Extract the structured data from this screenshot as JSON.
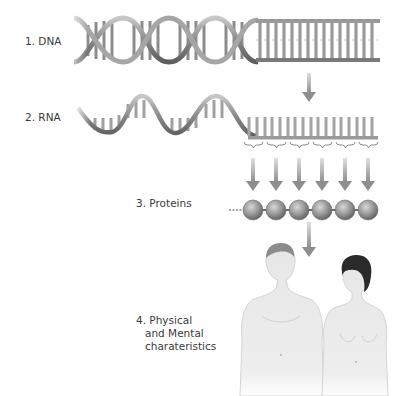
{
  "diagram": {
    "type": "flow",
    "direction": "top-to-bottom",
    "steps": [
      {
        "id": "dna",
        "label": "1. DNA",
        "visual": "double-helix-to-ladder"
      },
      {
        "id": "rna",
        "label": "2. RNA",
        "visual": "single-strand-wave-to-comb"
      },
      {
        "id": "proteins",
        "label": "3. Proteins",
        "visual": "bead-chain",
        "bead_count": 6
      },
      {
        "id": "traits",
        "label_lines": [
          "4. Physical",
          "and Mental",
          "charateristics"
        ],
        "visual": "male-and-female-figures"
      }
    ],
    "connections": [
      {
        "from": "dna",
        "to": "rna",
        "count": 1
      },
      {
        "from": "rna",
        "to": "proteins",
        "count": 6,
        "note": "codon groups bracketed"
      },
      {
        "from": "proteins",
        "to": "traits",
        "count": 1
      }
    ],
    "colors": {
      "strand": "#9a9a9a",
      "strand_dark": "#6e6e6e",
      "arrow": "#9c9c9c",
      "bead": "#8c8c8c",
      "text": "#3a3a3a",
      "skin": "#e9e9e9",
      "hair": "#2a2a2a"
    }
  }
}
